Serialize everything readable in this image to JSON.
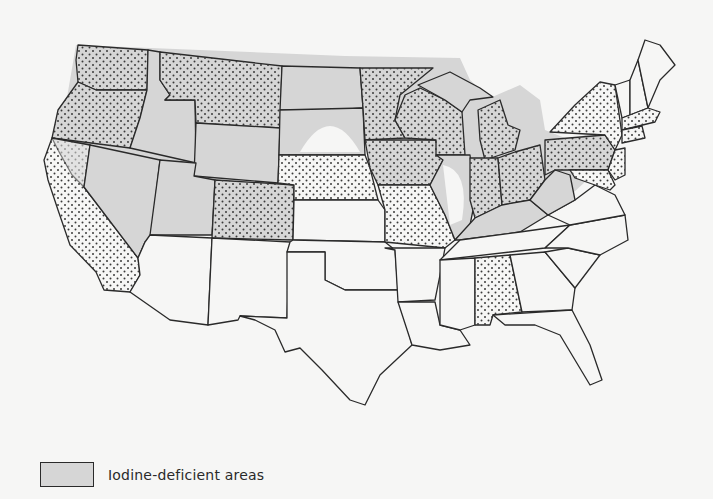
{
  "map": {
    "title": "",
    "region": "Contiguous United States",
    "colors": {
      "background": "#f6f6f5",
      "deficient": "#d6d6d6",
      "outline": "#2a2a2a",
      "stipple": "#3a3a3a"
    },
    "legend": {
      "items": [
        {
          "swatch": "gray-fill",
          "label": "Iodine-deficient areas"
        }
      ]
    },
    "stippled_states": [
      "Washington",
      "Oregon",
      "California",
      "Montana",
      "Minnesota",
      "Wisconsin",
      "Iowa",
      "Michigan",
      "Indiana",
      "Ohio",
      "Nebraska",
      "Colorado",
      "Missouri",
      "Pennsylvania",
      "New York",
      "New Jersey",
      "Maryland",
      "Delaware",
      "Massachusetts",
      "Connecticut",
      "Rhode Island",
      "Alabama"
    ],
    "deficient_states": [
      "Washington",
      "Oregon",
      "Idaho",
      "Montana",
      "Wyoming",
      "Nevada",
      "Utah",
      "North Dakota",
      "South Dakota",
      "Minnesota",
      "Wisconsin",
      "Michigan",
      "Iowa",
      "Illinois",
      "Indiana",
      "Ohio",
      "Kentucky",
      "West Virginia",
      "Pennsylvania",
      "Colorado",
      "California (north)"
    ]
  }
}
